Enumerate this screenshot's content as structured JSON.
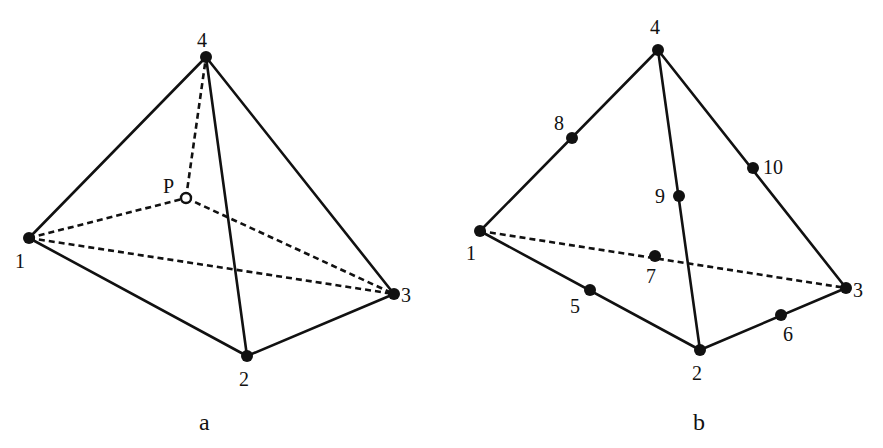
{
  "figure": {
    "panel_a": {
      "caption": "a",
      "nodes": [
        {
          "id": "1",
          "label": "1",
          "x": 29,
          "y": 238
        },
        {
          "id": "2",
          "label": "2",
          "x": 247,
          "y": 356
        },
        {
          "id": "3",
          "label": "3",
          "x": 394,
          "y": 294
        },
        {
          "id": "4",
          "label": "4",
          "x": 206,
          "y": 57
        }
      ],
      "interior_point": {
        "label": "P",
        "x": 186,
        "y": 198,
        "style": "hollow"
      },
      "solid_edges": [
        [
          "1",
          "4"
        ],
        [
          "4",
          "3"
        ],
        [
          "4",
          "2"
        ],
        [
          "1",
          "2"
        ],
        [
          "2",
          "3"
        ]
      ],
      "dashed_edges": [
        [
          "1",
          "3"
        ],
        [
          "1",
          "P"
        ],
        [
          "P",
          "3"
        ],
        [
          "P",
          "4"
        ]
      ]
    },
    "panel_b": {
      "caption": "b",
      "corner_nodes": [
        {
          "id": "1",
          "label": "1",
          "x": 480,
          "y": 231
        },
        {
          "id": "2",
          "label": "2",
          "x": 700,
          "y": 350
        },
        {
          "id": "3",
          "label": "3",
          "x": 846,
          "y": 288
        },
        {
          "id": "4",
          "label": "4",
          "x": 658,
          "y": 50
        }
      ],
      "midside_nodes": [
        {
          "id": "5",
          "label": "5",
          "edge": [
            "1",
            "2"
          ],
          "x": 590,
          "y": 290
        },
        {
          "id": "6",
          "label": "6",
          "edge": [
            "2",
            "3"
          ],
          "x": 781,
          "y": 315
        },
        {
          "id": "7",
          "label": "7",
          "edge": [
            "1",
            "3"
          ],
          "x": 655,
          "y": 256
        },
        {
          "id": "8",
          "label": "8",
          "edge": [
            "1",
            "4"
          ],
          "x": 572,
          "y": 138
        },
        {
          "id": "9",
          "label": "9",
          "edge": [
            "2",
            "4"
          ],
          "x": 679,
          "y": 196
        },
        {
          "id": "10",
          "label": "10",
          "edge": [
            "3",
            "4"
          ],
          "x": 753,
          "y": 168
        }
      ],
      "solid_edges": [
        [
          "1",
          "4"
        ],
        [
          "4",
          "3"
        ],
        [
          "4",
          "2"
        ],
        [
          "1",
          "2"
        ],
        [
          "2",
          "3"
        ]
      ],
      "dashed_edges": [
        [
          "1",
          "3"
        ]
      ]
    },
    "colors": {
      "stroke": "#111111",
      "background": "#ffffff"
    }
  }
}
